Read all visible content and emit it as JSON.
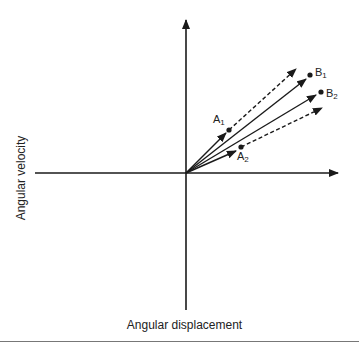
{
  "diagram": {
    "x_axis_label": "Angular displacement",
    "y_axis_label": "Angular velocity",
    "origin": {
      "x": 186,
      "y": 173
    },
    "axes": {
      "horizontal": {
        "x1": 35,
        "x2": 338,
        "y": 173
      },
      "vertical": {
        "x": 186,
        "y1": 310,
        "y2": 20
      }
    },
    "points": [
      {
        "id": "A1",
        "letter": "A",
        "subscript": "1",
        "dot": {
          "x": 229,
          "y": 130
        },
        "label_pos": {
          "x": 213,
          "y": 113
        }
      },
      {
        "id": "A2",
        "letter": "A",
        "subscript": "2",
        "dot": {
          "x": 241,
          "y": 147
        },
        "label_pos": {
          "x": 237,
          "y": 150
        }
      },
      {
        "id": "B1",
        "letter": "B",
        "subscript": "1",
        "dot": {
          "x": 310,
          "y": 75
        },
        "label_pos": {
          "x": 315,
          "y": 66
        }
      },
      {
        "id": "B2",
        "letter": "B",
        "subscript": "2",
        "dot": {
          "x": 321,
          "y": 92
        },
        "label_pos": {
          "x": 326,
          "y": 87
        }
      }
    ],
    "vectors": [
      {
        "name": "solid-vector-to-A1",
        "style": "solid",
        "to": {
          "x": 226,
          "y": 133
        }
      },
      {
        "name": "solid-vector-to-A2",
        "style": "solid",
        "to": {
          "x": 236,
          "y": 151
        }
      },
      {
        "name": "solid-vector-to-B1",
        "style": "solid",
        "to": {
          "x": 306,
          "y": 79
        }
      },
      {
        "name": "solid-vector-to-B2",
        "style": "solid",
        "to": {
          "x": 316,
          "y": 95
        }
      },
      {
        "name": "dashed-vector-upper",
        "style": "dashed",
        "from": {
          "x": 229,
          "y": 130
        },
        "to": {
          "x": 296,
          "y": 69
        }
      },
      {
        "name": "dashed-vector-lower",
        "style": "dashed",
        "from": {
          "x": 241,
          "y": 147
        },
        "to": {
          "x": 322,
          "y": 108
        }
      }
    ],
    "colors": {
      "line": "#1a1a1a",
      "text": "#222222",
      "rule": "#777777"
    }
  }
}
